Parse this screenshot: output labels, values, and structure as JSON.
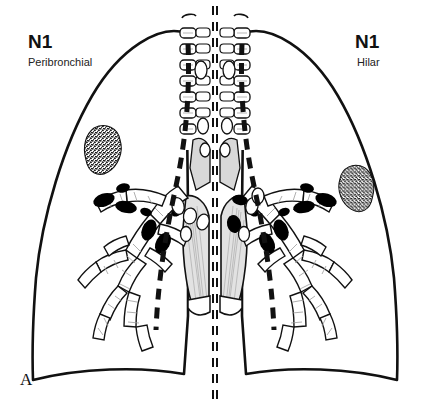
{
  "figure": {
    "panel_label": "A",
    "background_color": "#ffffff",
    "ink_color": "#111111",
    "node_fill_color": "#000000",
    "mediastinum_fill_color": "#d8d8d8",
    "tumor_texture": "stippled"
  },
  "labels": {
    "left": {
      "station": "N1",
      "descriptor": "Peribronchial"
    },
    "right": {
      "station": "N1",
      "descriptor": "Hilar"
    }
  },
  "icons": {
    "left_tumor": "tumor-mass-icon",
    "right_tumor": "tumor-mass-icon",
    "lymph_node": "lymph-node-icon",
    "trachea": "trachea-icon",
    "bronchus": "bronchus-icon"
  },
  "anatomy": {
    "left_panel_title": "Peribronchial nodes",
    "right_panel_title": "Hilar nodes",
    "structures": [
      "lung-outline-left",
      "lung-outline-right",
      "trachea-left",
      "trachea-right",
      "bronchial-tree-left",
      "bronchial-tree-right",
      "mediastinum-left",
      "mediastinum-right",
      "pleural-boundary-dashed-left",
      "pleural-boundary-dashed-right",
      "midline-dashed-left",
      "midline-dashed-right"
    ]
  }
}
